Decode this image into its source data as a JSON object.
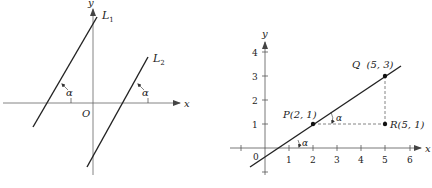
{
  "left_figure": {
    "axis_x_label": "x",
    "axis_y_label": "y",
    "origin_label": "O",
    "line1_label": "L",
    "line1_sub": "1",
    "line2_label": "L",
    "line2_sub": "2",
    "angle1_label": "α",
    "angle2_label": "α"
  },
  "right_figure": {
    "axis_x_label": "x",
    "axis_y_label": "y",
    "origin_label": "0",
    "x_ticks": [
      "1",
      "2",
      "3",
      "4",
      "5",
      "6"
    ],
    "y_ticks": [
      "1",
      "2",
      "3",
      "4"
    ],
    "points": {
      "P": "P(2, 1)",
      "Q": "Q  (5, 3)",
      "R": "R(5, 1)"
    },
    "angle_upper_label": "α",
    "angle_lower_label": "α"
  },
  "colors": {
    "line": "#222222",
    "axis": "#555555",
    "dashed": "#666666"
  }
}
